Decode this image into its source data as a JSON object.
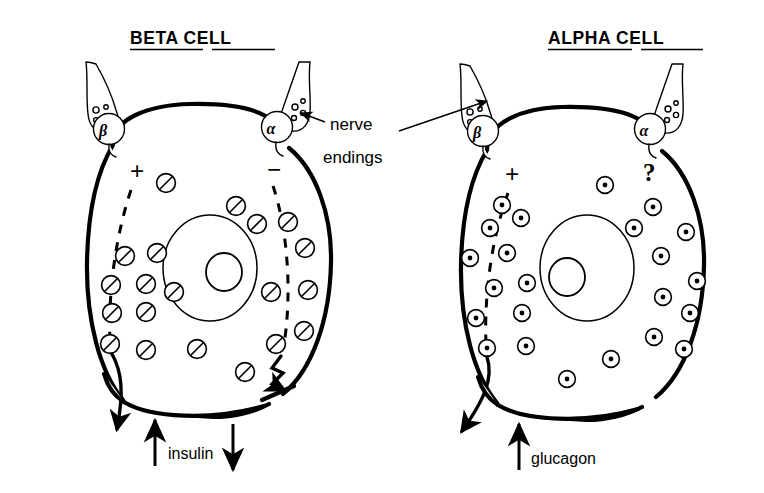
{
  "figure": {
    "background_color": "#ffffff",
    "ink_color": "#000000",
    "caption_kind": "line-drawing"
  },
  "panels": [
    {
      "id": "beta-panel",
      "title": "BETA CELL",
      "title_words": [
        "BETA",
        "CELL"
      ],
      "hormone": "insulin",
      "hormone_arrows": [
        "up",
        "down"
      ],
      "granule_style": "slashed-circle",
      "receptors": [
        {
          "symbol": "β",
          "name": "beta-receptor",
          "side": "left",
          "sign": "+",
          "effect": "stimulates secretion"
        },
        {
          "symbol": "α",
          "name": "alpha-receptor",
          "side": "right",
          "sign": "−",
          "effect": "inhibits secretion"
        }
      ],
      "secretion_paths": [
        {
          "side": "left",
          "style": "smooth-arrow",
          "meaning": "release"
        },
        {
          "side": "right",
          "style": "zigzag-arrow",
          "meaning": "blocked release"
        }
      ]
    },
    {
      "id": "alpha-panel",
      "title": "ALPHA CELL",
      "title_words": [
        "ALPHA",
        "CELL"
      ],
      "hormone": "glucagon",
      "hormone_arrows": [
        "up"
      ],
      "granule_style": "dotted-circle",
      "receptors": [
        {
          "symbol": "β",
          "name": "beta-receptor",
          "side": "left",
          "sign": "+",
          "effect": "stimulates secretion"
        },
        {
          "symbol": "α",
          "name": "alpha-receptor",
          "side": "right",
          "sign": "?",
          "effect": "unknown"
        }
      ],
      "secretion_paths": [
        {
          "side": "left",
          "style": "smooth-arrow",
          "meaning": "release"
        }
      ]
    }
  ],
  "annotation": {
    "label_line_1": "nerve",
    "label_line_2": "endings",
    "pointer_targets": [
      "beta-cell-alpha-terminal",
      "alpha-cell-beta-terminal"
    ]
  },
  "symbols": {
    "plus": "+",
    "minus": "−",
    "question": "?",
    "beta": "β",
    "alpha": "α"
  }
}
